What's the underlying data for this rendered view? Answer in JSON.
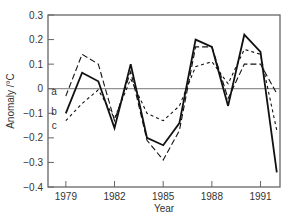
{
  "chart_data": {
    "type": "line",
    "title": "",
    "xlabel": "Year",
    "ylabel": "Anomaly /°C",
    "xlim": [
      1977.9,
      1992.2
    ],
    "ylim": [
      -0.4,
      0.3
    ],
    "grid": false,
    "zero_line": true,
    "x_ticks": [
      1979,
      1982,
      1985,
      1988,
      1991
    ],
    "x_tick_labels": [
      "1979",
      "1982",
      "1985",
      "1988",
      "1991"
    ],
    "y_ticks": [
      -0.4,
      -0.3,
      -0.2,
      -0.1,
      0,
      0.1,
      0.2,
      0.3
    ],
    "y_tick_labels": [
      "−0.4",
      "−0.3",
      "−0.2",
      "−0.1",
      "0",
      "0.1",
      "0.2",
      "0.3"
    ],
    "x": [
      1979,
      1980,
      1981,
      1982,
      1983,
      1984,
      1985,
      1986,
      1987,
      1988,
      1989,
      1990,
      1991,
      1992
    ],
    "series": [
      {
        "name": "a",
        "style": "long-dash",
        "values": [
          -0.03,
          0.14,
          0.1,
          -0.13,
          0.07,
          -0.21,
          -0.29,
          -0.17,
          0.17,
          0.17,
          -0.04,
          0.1,
          0.1,
          -0.02
        ]
      },
      {
        "name": "b",
        "style": "solid",
        "values": [
          -0.1,
          0.065,
          0.03,
          -0.16,
          0.1,
          -0.2,
          -0.23,
          -0.14,
          0.2,
          0.17,
          -0.07,
          0.22,
          0.15,
          -0.34
        ]
      },
      {
        "name": "c",
        "style": "short-dash",
        "values": [
          -0.13,
          -0.06,
          -0.005,
          -0.12,
          0.04,
          -0.1,
          -0.13,
          -0.07,
          0.09,
          0.11,
          0.02,
          0.16,
          0.14,
          -0.17
        ]
      }
    ],
    "legend": "inline-labels-left"
  }
}
